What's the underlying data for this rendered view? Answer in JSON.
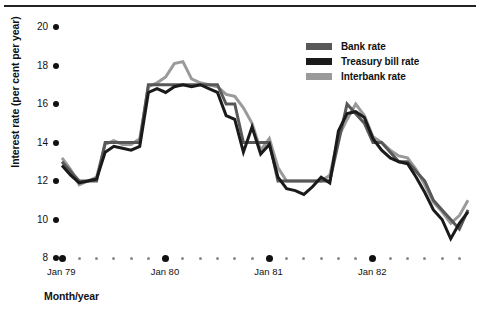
{
  "figure": {
    "has_top_rule": true,
    "background": "#ffffff"
  },
  "axis_title_x": "Month/year",
  "axis_title_y": "Interest rate (per cent per year)",
  "legend": {
    "position": "top-right",
    "items": [
      {
        "label": "Bank rate",
        "color": "#585858"
      },
      {
        "label": "Treasury bill rate",
        "color": "#1a1a1a"
      },
      {
        "label": "Interbank rate",
        "color": "#9a9a9a"
      }
    ]
  },
  "yticks": [
    "8",
    "10",
    "12",
    "14",
    "16",
    "18",
    "20"
  ],
  "xticks_major": [
    "Jan 79",
    "Jan 80",
    "Jan 81",
    "Jan 82"
  ],
  "chart_data": {
    "type": "line",
    "title": "",
    "subtitle": "",
    "xlabel": "Month/year",
    "ylabel": "Interest rate (per cent per year)",
    "ylim": [
      8,
      20
    ],
    "yticks": [
      8,
      10,
      12,
      14,
      16,
      18,
      20
    ],
    "grid": false,
    "legend_position": "top-right",
    "x_start": "Jan 79",
    "x_end": "Dec 82",
    "x_unit": "month",
    "x_tick_interval_months": 2,
    "x_major_labels": [
      "Jan 79",
      "Jan 80",
      "Jan 81",
      "Jan 82"
    ],
    "x": [
      "Jan 79",
      "Feb 79",
      "Mar 79",
      "Apr 79",
      "May 79",
      "Jun 79",
      "Jul 79",
      "Aug 79",
      "Sep 79",
      "Oct 79",
      "Nov 79",
      "Dec 79",
      "Jan 80",
      "Feb 80",
      "Mar 80",
      "Apr 80",
      "May 80",
      "Jun 80",
      "Jul 80",
      "Aug 80",
      "Sep 80",
      "Oct 80",
      "Nov 80",
      "Dec 80",
      "Jan 81",
      "Feb 81",
      "Mar 81",
      "Apr 81",
      "May 81",
      "Jun 81",
      "Jul 81",
      "Aug 81",
      "Sep 81",
      "Oct 81",
      "Nov 81",
      "Dec 81",
      "Jan 82",
      "Feb 82",
      "Mar 82",
      "Apr 82",
      "May 82",
      "Jun 82",
      "Jul 82",
      "Aug 82",
      "Sep 82",
      "Oct 82",
      "Nov 82",
      "Dec 82"
    ],
    "series": [
      {
        "name": "Bank rate",
        "color": "#585858",
        "values": [
          13.0,
          12.5,
          12.0,
          12.0,
          12.0,
          14.0,
          14.0,
          14.0,
          14.0,
          14.0,
          17.0,
          17.0,
          17.0,
          17.0,
          17.0,
          17.0,
          17.0,
          17.0,
          17.0,
          16.0,
          16.0,
          14.0,
          14.0,
          14.0,
          14.0,
          12.0,
          12.0,
          12.0,
          12.0,
          12.0,
          12.0,
          12.0,
          14.0,
          16.0,
          15.5,
          15.0,
          14.0,
          14.0,
          13.5,
          13.0,
          13.0,
          12.5,
          12.0,
          11.0,
          10.5,
          10.0,
          9.5,
          10.5
        ]
      },
      {
        "name": "Treasury bill rate",
        "color": "#1a1a1a",
        "values": [
          12.8,
          12.3,
          11.9,
          12.0,
          12.1,
          13.5,
          13.8,
          13.7,
          13.6,
          13.8,
          16.6,
          16.8,
          16.6,
          16.9,
          17.0,
          16.9,
          17.0,
          16.8,
          16.6,
          15.4,
          15.2,
          13.5,
          14.8,
          13.4,
          13.9,
          12.2,
          11.6,
          11.5,
          11.3,
          11.7,
          12.2,
          11.9,
          14.6,
          15.5,
          15.6,
          15.3,
          14.2,
          13.6,
          13.2,
          13.0,
          12.9,
          12.2,
          11.4,
          10.5,
          10.0,
          9.0,
          9.8,
          10.4
        ]
      },
      {
        "name": "Interbank rate",
        "color": "#9a9a9a",
        "values": [
          13.2,
          12.6,
          11.8,
          12.0,
          12.2,
          13.9,
          14.1,
          13.9,
          13.9,
          14.2,
          16.9,
          17.1,
          17.4,
          18.1,
          18.2,
          17.3,
          17.1,
          17.0,
          16.9,
          16.5,
          16.4,
          15.8,
          15.0,
          13.6,
          14.2,
          12.7,
          12.0,
          12.0,
          12.0,
          12.0,
          12.0,
          12.3,
          14.3,
          15.2,
          16.0,
          15.4,
          14.3,
          14.0,
          13.6,
          13.3,
          13.2,
          12.6,
          11.8,
          10.9,
          10.4,
          9.8,
          10.2,
          11.0
        ]
      }
    ]
  }
}
